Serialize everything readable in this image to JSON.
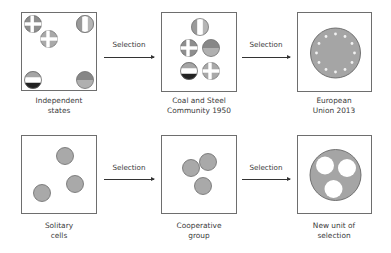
{
  "rows": [
    {
      "stages": [
        {
          "label_line1": "Independent",
          "label_line2": "states"
        },
        {
          "label_line1": "Coal and Steel",
          "label_line2": "Community 1950"
        },
        {
          "label_line1": "European",
          "label_line2": "Union 2013"
        }
      ],
      "arrows": [
        {
          "label": "Selection"
        },
        {
          "label": "Selection"
        }
      ]
    },
    {
      "stages": [
        {
          "label_line1": "Solitary",
          "label_line2": "cells"
        },
        {
          "label_line1": "Cooperative",
          "label_line2": "group"
        },
        {
          "label_line1": "New unit of",
          "label_line2": "selection"
        }
      ],
      "arrows": [
        {
          "label": "Selection"
        },
        {
          "label": "Selection"
        }
      ]
    }
  ],
  "colors": {
    "circle_fill": "#a9a9a9",
    "circle_stroke": "#6a6a6a",
    "box_border": "#6e6e6e",
    "arrow": "#333333"
  }
}
